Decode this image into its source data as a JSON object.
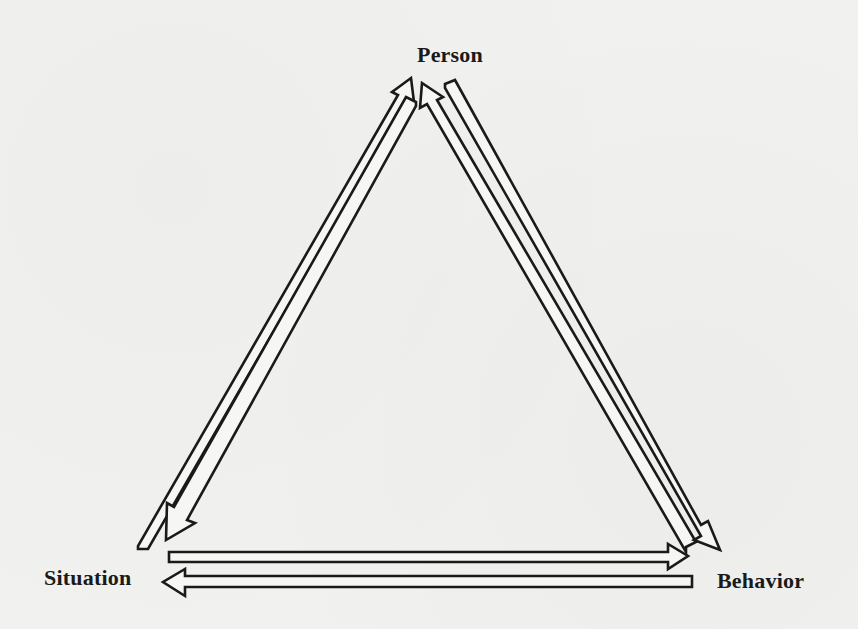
{
  "diagram": {
    "type": "triadic-reciprocal-causation",
    "nodes": [
      {
        "id": "person",
        "label": "Person"
      },
      {
        "id": "situation",
        "label": "Situation"
      },
      {
        "id": "behavior",
        "label": "Behavior"
      }
    ],
    "edges": [
      {
        "from": "situation",
        "to": "person",
        "style": "hollow-arrow"
      },
      {
        "from": "person",
        "to": "situation",
        "style": "hollow-arrow"
      },
      {
        "from": "person",
        "to": "behavior",
        "style": "hollow-arrow"
      },
      {
        "from": "behavior",
        "to": "person",
        "style": "hollow-arrow"
      },
      {
        "from": "situation",
        "to": "behavior",
        "style": "hollow-arrow"
      },
      {
        "from": "behavior",
        "to": "situation",
        "style": "hollow-arrow"
      }
    ],
    "colors": {
      "background": "#f1f1ef",
      "stroke": "#1a1a1a",
      "arrow_fill": "#f6f6f4"
    }
  }
}
